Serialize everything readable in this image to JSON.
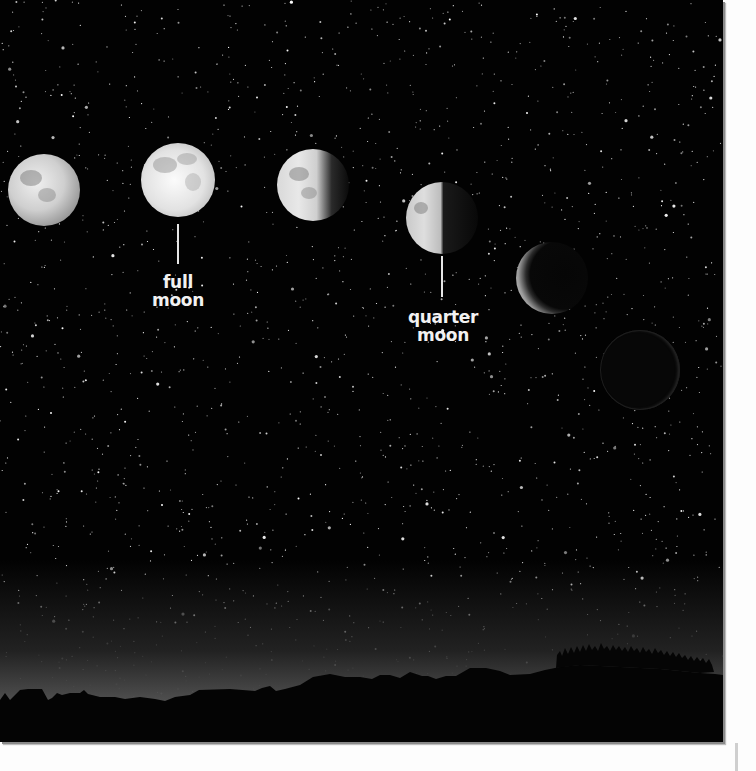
{
  "scene": {
    "title": "Phases of the Moon over a night sky",
    "background": "starry night sky with silhouetted hills and trees",
    "colors": {
      "sky": "#020202",
      "moon_lit": "#e8e8e8",
      "moon_shadow": "#6e6e6e",
      "label": "#f2f2f2",
      "page": "#fdfdfd"
    }
  },
  "moons": [
    {
      "phase": "waxing-gibbous",
      "cx": 44,
      "cy": 190,
      "r": 36
    },
    {
      "phase": "full",
      "cx": 178,
      "cy": 180,
      "r": 37
    },
    {
      "phase": "waning-gibbous",
      "cx": 313,
      "cy": 185,
      "r": 36
    },
    {
      "phase": "quarter",
      "cx": 442,
      "cy": 218,
      "r": 36
    },
    {
      "phase": "crescent",
      "cx": 552,
      "cy": 278,
      "r": 36
    },
    {
      "phase": "new",
      "cx": 640,
      "cy": 370,
      "r": 40
    }
  ],
  "labels": {
    "full_moon": {
      "line1": "full",
      "line2": "moon"
    },
    "quarter_moon": {
      "line1": "quarter",
      "line2": "moon"
    }
  }
}
